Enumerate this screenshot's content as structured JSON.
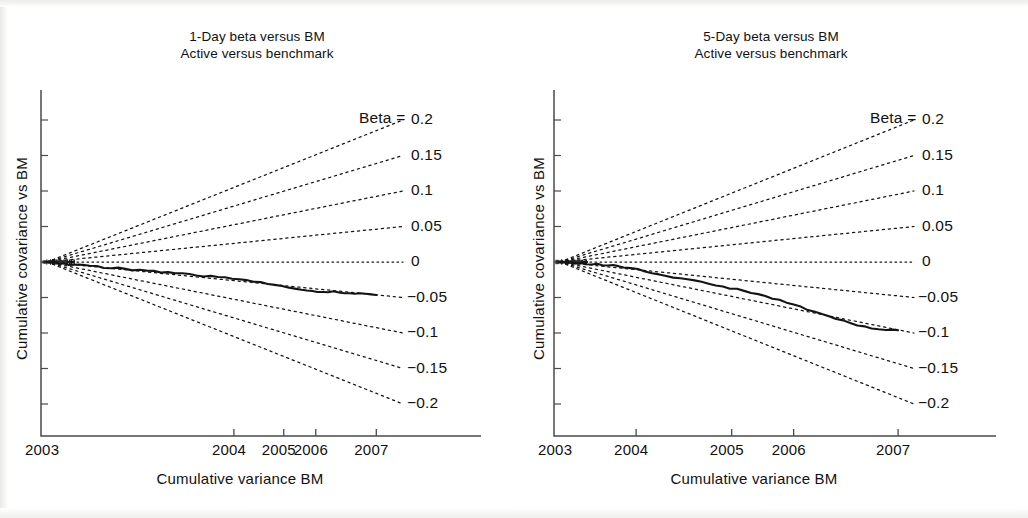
{
  "figure": {
    "background": "#ffffff",
    "ink_color": "#141414",
    "panel_count": 2
  },
  "chart_data": [
    {
      "type": "line",
      "panel": "left",
      "title": "1-Day beta versus BM",
      "subtitle": "Active versus benchmark",
      "xlabel": "Cumulative variance BM",
      "ylabel": "Cumulative covariance vs BM",
      "grid": false,
      "legend_position": "right-outside",
      "xticks": [
        {
          "label": "2003",
          "pos": 0.0
        },
        {
          "label": "2004",
          "pos": 0.525
        },
        {
          "label": "2005",
          "pos": 0.665
        },
        {
          "label": "2006",
          "pos": 0.755
        },
        {
          "label": "2007",
          "pos": 0.925
        }
      ],
      "xlim": [
        0,
        1
      ],
      "ylim": [
        -0.26,
        0.26
      ],
      "origin_y": 0.0,
      "beta_lines": {
        "label_prefix": "Beta =",
        "values": [
          0.2,
          0.15,
          0.1,
          0.05,
          0,
          -0.05,
          -0.1,
          -0.15,
          -0.2
        ],
        "labels": [
          "0.2",
          "0.15",
          "0.1",
          "0.05",
          "0",
          "−0.05",
          "−0.1",
          "−0.15",
          "−0.2"
        ],
        "style": "dotted"
      },
      "series": [
        {
          "name": "Active versus benchmark",
          "style": "solid",
          "end_beta": -0.05,
          "x": [
            0.0,
            0.012,
            0.024,
            0.036,
            0.048,
            0.06,
            0.075,
            0.09,
            0.105,
            0.12,
            0.14,
            0.16,
            0.18,
            0.2,
            0.22,
            0.24,
            0.26,
            0.28,
            0.3,
            0.32,
            0.34,
            0.36,
            0.38,
            0.4,
            0.42,
            0.44,
            0.46,
            0.48,
            0.5,
            0.52,
            0.54,
            0.56,
            0.58,
            0.6,
            0.62,
            0.64,
            0.66,
            0.68,
            0.7,
            0.715,
            0.73,
            0.745,
            0.76,
            0.775,
            0.79,
            0.805,
            0.82,
            0.835,
            0.85,
            0.865,
            0.88,
            0.895,
            0.91,
            0.925
          ],
          "y": [
            0.0,
            -0.0008,
            -0.0014,
            -0.0022,
            -0.0028,
            -0.0034,
            -0.004,
            -0.0046,
            -0.0052,
            -0.0058,
            -0.0066,
            -0.0074,
            -0.0082,
            -0.009,
            -0.0099,
            -0.011,
            -0.0118,
            -0.0126,
            -0.0133,
            -0.0141,
            -0.0152,
            -0.0159,
            -0.0167,
            -0.0176,
            -0.0186,
            -0.0194,
            -0.0203,
            -0.0211,
            -0.0222,
            -0.0232,
            -0.0244,
            -0.0256,
            -0.027,
            -0.0284,
            -0.0299,
            -0.0316,
            -0.0334,
            -0.0352,
            -0.0372,
            -0.0386,
            -0.0396,
            -0.0404,
            -0.0412,
            -0.042,
            -0.0428,
            -0.0421,
            -0.0428,
            -0.0436,
            -0.0444,
            -0.0448,
            -0.045,
            -0.0452,
            -0.0453,
            -0.0455
          ]
        }
      ]
    },
    {
      "type": "line",
      "panel": "right",
      "title": "5-Day beta versus BM",
      "subtitle": "Active versus benchmark",
      "xlabel": "Cumulative variance BM",
      "ylabel": "Cumulative covariance vs BM",
      "grid": false,
      "legend_position": "right-outside",
      "xticks": [
        {
          "label": "2003",
          "pos": 0.0
        },
        {
          "label": "2004",
          "pos": 0.215
        },
        {
          "label": "2005",
          "pos": 0.485
        },
        {
          "label": "2006",
          "pos": 0.66
        },
        {
          "label": "2007",
          "pos": 0.955
        }
      ],
      "xlim": [
        0,
        1
      ],
      "ylim": [
        -0.26,
        0.26
      ],
      "origin_y": 0.0,
      "beta_lines": {
        "label_prefix": "Beta =",
        "values": [
          0.2,
          0.15,
          0.1,
          0.05,
          0,
          -0.05,
          -0.1,
          -0.15,
          -0.2
        ],
        "labels": [
          "0.2",
          "0.15",
          "0.1",
          "0.05",
          "0",
          "−0.05",
          "−0.1",
          "−0.15",
          "−0.2"
        ],
        "style": "dotted"
      },
      "series": [
        {
          "name": "Active versus benchmark",
          "style": "solid",
          "end_beta": -0.1,
          "x": [
            0.0,
            0.015,
            0.03,
            0.045,
            0.06,
            0.075,
            0.09,
            0.105,
            0.12,
            0.135,
            0.15,
            0.165,
            0.18,
            0.2,
            0.22,
            0.24,
            0.26,
            0.28,
            0.3,
            0.32,
            0.34,
            0.36,
            0.38,
            0.4,
            0.42,
            0.44,
            0.46,
            0.48,
            0.5,
            0.52,
            0.54,
            0.56,
            0.58,
            0.6,
            0.62,
            0.64,
            0.66,
            0.68,
            0.7,
            0.72,
            0.74,
            0.76,
            0.78,
            0.8,
            0.82,
            0.84,
            0.86,
            0.88,
            0.9,
            0.92,
            0.94,
            0.955
          ],
          "y": [
            0.0,
            -0.0004,
            -0.0008,
            -0.0012,
            -0.0016,
            -0.0022,
            -0.0026,
            -0.003,
            -0.0036,
            -0.0044,
            -0.0054,
            -0.0064,
            -0.0074,
            -0.009,
            -0.0108,
            -0.0128,
            -0.015,
            -0.017,
            -0.0192,
            -0.021,
            -0.0232,
            -0.0252,
            -0.0268,
            -0.0286,
            -0.0306,
            -0.0326,
            -0.0348,
            -0.0368,
            -0.0388,
            -0.041,
            -0.0434,
            -0.0458,
            -0.0484,
            -0.0512,
            -0.0542,
            -0.0572,
            -0.0604,
            -0.0636,
            -0.0668,
            -0.07,
            -0.0732,
            -0.0766,
            -0.08,
            -0.0832,
            -0.0862,
            -0.0888,
            -0.091,
            -0.0928,
            -0.0942,
            -0.0952,
            -0.096,
            -0.0965
          ]
        }
      ]
    }
  ]
}
